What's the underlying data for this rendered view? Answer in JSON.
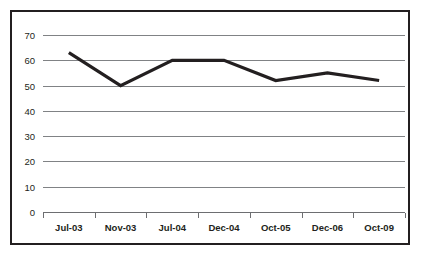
{
  "chart_data": {
    "type": "line",
    "title": "",
    "subtitle": "",
    "xlabel": "",
    "ylabel": "",
    "categories": [
      "Jul-03",
      "Nov-03",
      "Jul-04",
      "Dec-04",
      "Oct-05",
      "Dec-06",
      "Oct-09"
    ],
    "values": [
      63,
      50,
      60,
      60,
      52,
      55,
      52
    ],
    "series": [
      {
        "name": "Series 1",
        "values": [
          63,
          50,
          60,
          60,
          52,
          55,
          52
        ]
      }
    ],
    "ylim": [
      0,
      70
    ],
    "ytick_labels": [
      "0",
      "10",
      "20",
      "30",
      "40",
      "50",
      "60",
      "70"
    ],
    "ytick_values": [
      0,
      10,
      20,
      30,
      40,
      50,
      60,
      70
    ],
    "grid": true,
    "grid_axis": "y",
    "legend": false,
    "legend_position": "none",
    "annotations": [],
    "colors": {
      "line": "#231f20",
      "grid": "#808285",
      "axis": "#6d6e71",
      "frame": "#231f20",
      "background": "#ffffff",
      "text": "#231f20"
    }
  }
}
